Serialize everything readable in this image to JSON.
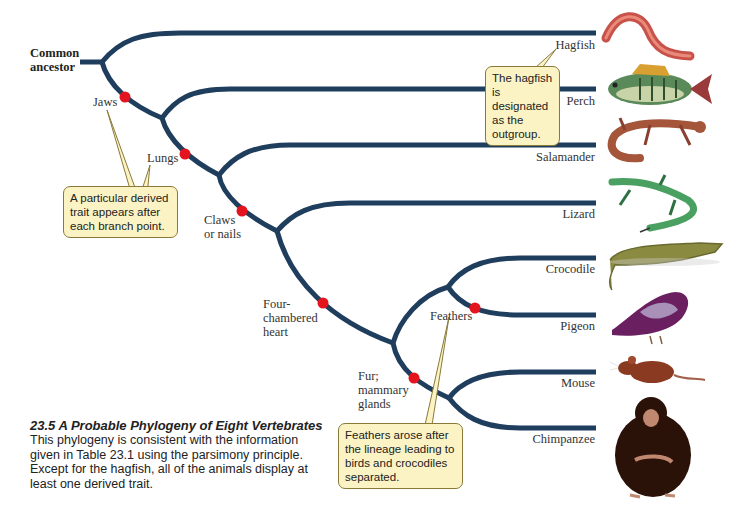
{
  "root_label": {
    "line1": "Common",
    "line2": "ancestor"
  },
  "taxa": [
    {
      "name": "Hagfish"
    },
    {
      "name": "Perch"
    },
    {
      "name": "Salamander"
    },
    {
      "name": "Lizard"
    },
    {
      "name": "Crocodile"
    },
    {
      "name": "Pigeon"
    },
    {
      "name": "Mouse"
    },
    {
      "name": "Chimpanzee"
    }
  ],
  "traits": [
    {
      "name": "Jaws"
    },
    {
      "name": "Lungs"
    },
    {
      "name": "Claws",
      "line2": "or nails"
    },
    {
      "name": "Four-",
      "line2": "chambered",
      "line3": "heart"
    },
    {
      "name": "Fur;",
      "line2": "mammary",
      "line3": "glands"
    },
    {
      "name": "Feathers"
    }
  ],
  "callouts": {
    "derived_trait": "A particular derived trait appears after each branch point.",
    "outgroup": "The hagfish is designated as the outgroup.",
    "feathers": "Feathers arose after the lineage leading to birds and crocodiles separated."
  },
  "caption": {
    "title": "23.5  A Probable Phylogeny of Eight Vertebrates",
    "body": "This phylogeny is consistent with the information given in Table 23.1 using the parsimony principle. Except for the hagfish, all of the animals display at least one derived trait."
  },
  "colors": {
    "branch": "#1f3d5c",
    "trait_dot": "#e3141e",
    "callout_fill": "#fbf3c4"
  }
}
